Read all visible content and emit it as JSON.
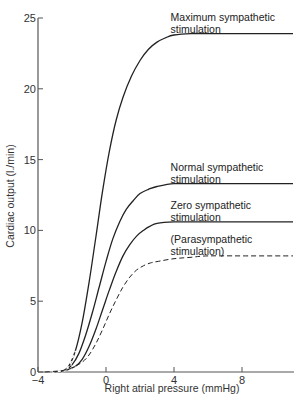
{
  "chart_data": {
    "type": "line",
    "title": "",
    "xlabel": "Right atrial pressure (mmHg)",
    "ylabel": "Cardiac output (l./min)",
    "xlim": [
      -4,
      11
    ],
    "ylim": [
      0,
      25
    ],
    "x_ticks": [
      -4,
      0,
      4,
      8
    ],
    "x_tick_labels": [
      "−4",
      "0",
      "4",
      "8"
    ],
    "y_ticks": [
      0,
      5,
      10,
      15,
      20,
      25
    ],
    "y_tick_labels": [
      "0",
      "5",
      "10",
      "15",
      "20",
      "25"
    ],
    "grid": false,
    "legend": "inline labels at right end of each curve",
    "series": [
      {
        "name": "Maximum sympathetic stimulation",
        "label_lines": [
          "Maximum sympathetic",
          "stimulation"
        ],
        "style": "solid",
        "x": [
          -2.6,
          -2.2,
          -1.8,
          -1.4,
          -1.0,
          -0.6,
          -0.2,
          0.2,
          0.6,
          1.0,
          1.5,
          2.0,
          2.5,
          3.0,
          3.5,
          4.0,
          5.0,
          6.0,
          8.0,
          11.0
        ],
        "y": [
          0.0,
          0.4,
          1.5,
          3.5,
          6.3,
          9.5,
          12.8,
          15.6,
          17.8,
          19.4,
          20.9,
          22.0,
          22.8,
          23.3,
          23.6,
          23.8,
          23.9,
          23.9,
          23.9,
          23.9
        ]
      },
      {
        "name": "Normal sympathetic stimulation",
        "label_lines": [
          "Normal sympathetic",
          "stimulation"
        ],
        "style": "solid",
        "x": [
          -3.0,
          -2.4,
          -2.0,
          -1.6,
          -1.2,
          -0.8,
          -0.4,
          0.0,
          0.4,
          0.8,
          1.2,
          1.6,
          2.0,
          2.5,
          3.0,
          4.0,
          5.0,
          6.0,
          8.0,
          11.0
        ],
        "y": [
          0.0,
          0.1,
          0.5,
          1.3,
          2.6,
          4.2,
          6.0,
          7.8,
          9.4,
          10.6,
          11.5,
          12.1,
          12.6,
          12.9,
          13.1,
          13.3,
          13.3,
          13.3,
          13.3,
          13.3
        ]
      },
      {
        "name": "Zero sympathetic stimulation",
        "label_lines": [
          "Zero sympathetic",
          "stimulation"
        ],
        "style": "solid",
        "x": [
          -3.2,
          -2.4,
          -1.8,
          -1.4,
          -1.0,
          -0.6,
          -0.2,
          0.2,
          0.6,
          1.0,
          1.4,
          1.8,
          2.2,
          2.6,
          3.0,
          4.0,
          5.0,
          6.0,
          8.0,
          11.0
        ],
        "y": [
          0.0,
          0.1,
          0.4,
          0.9,
          1.8,
          3.0,
          4.4,
          5.8,
          7.1,
          8.2,
          9.0,
          9.6,
          10.0,
          10.3,
          10.5,
          10.6,
          10.6,
          10.6,
          10.6,
          10.6
        ]
      },
      {
        "name": "(Parasympathetic stimulation)",
        "label_lines": [
          "(Parasympathetic",
          "stimulation)"
        ],
        "style": "dashed",
        "x": [
          -3.6,
          -2.6,
          -2.0,
          -1.4,
          -1.0,
          -0.6,
          -0.2,
          0.2,
          0.6,
          1.0,
          1.4,
          1.8,
          2.2,
          2.6,
          3.0,
          4.0,
          5.0,
          6.0,
          8.0,
          11.0
        ],
        "y": [
          0.0,
          0.1,
          0.3,
          0.7,
          1.2,
          2.0,
          3.0,
          4.1,
          5.1,
          6.0,
          6.7,
          7.2,
          7.5,
          7.7,
          7.8,
          8.0,
          8.1,
          8.2,
          8.2,
          8.2
        ]
      }
    ],
    "annotations": [
      {
        "text": "Maximum sympathetic stimulation",
        "x": 3.8,
        "y": 24.8
      },
      {
        "text": "Normal sympathetic stimulation",
        "x": 3.8,
        "y": 14.2
      },
      {
        "text": "Zero sympathetic stimulation",
        "x": 3.8,
        "y": 11.5
      },
      {
        "text": "(Parasympathetic stimulation)",
        "x": 3.8,
        "y": 9.1
      }
    ]
  },
  "colors": {
    "axis": "#555555",
    "curve": "#222222",
    "text": "#333333",
    "background": "#ffffff"
  }
}
